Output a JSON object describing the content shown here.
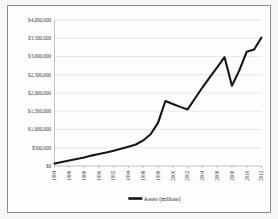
{
  "figure": {
    "background_color": "#fdfdfc",
    "border_color": "#8d8d8d",
    "line_color": "#161616",
    "grid_color": "#d2d2d2",
    "axis_color": "#9a9a9a"
  },
  "legend": {
    "position": "bottom-center",
    "entries": [
      {
        "label": "Assets (millions)",
        "color": "#161616",
        "marker": "line-swatch"
      }
    ]
  },
  "axes": {
    "y": {
      "ticks": [
        "$0",
        "$500,000",
        "$1,000,000",
        "$1,500,000",
        "$2,000,000",
        "$2,500,000",
        "$3,000,000",
        "$3,500,000",
        "$4,000,000"
      ]
    },
    "x": {
      "ticks": [
        "1984",
        "1986",
        "1988",
        "1990",
        "1992",
        "1994",
        "1996",
        "1998",
        "2000",
        "2002",
        "2004",
        "2006",
        "2008",
        "2010",
        "2012"
      ],
      "label_rotation": "-90"
    }
  },
  "chart_data": {
    "type": "line",
    "title": "",
    "xlabel": "",
    "ylabel": "",
    "xlim": [
      1984,
      2012
    ],
    "ylim": [
      0,
      4000000
    ],
    "ytick_values": [
      0,
      500000,
      1000000,
      1500000,
      2000000,
      2500000,
      3000000,
      3500000,
      4000000
    ],
    "ytick_labels": [
      "$0",
      "$500,000",
      "$1,000,000",
      "$1,500,000",
      "$2,000,000",
      "$2,500,000",
      "$3,000,000",
      "$3,500,000",
      "$4,000,000"
    ],
    "xtick_values": [
      1984,
      1986,
      1988,
      1990,
      1992,
      1994,
      1996,
      1998,
      2000,
      2002,
      2004,
      2006,
      2008,
      2010,
      2012
    ],
    "xtick_labels": [
      "1984",
      "1986",
      "1988",
      "1990",
      "1992",
      "1994",
      "1996",
      "1998",
      "2000",
      "2002",
      "2004",
      "2006",
      "2008",
      "2010",
      "2012"
    ],
    "grid": "horizontal",
    "legend_position": "bottom",
    "x": [
      1984,
      1985,
      1986,
      1987,
      1988,
      1989,
      1990,
      1991,
      1992,
      1993,
      1994,
      1995,
      1996,
      1997,
      1998,
      1999,
      2000,
      2001,
      2002,
      2003,
      2004,
      2005,
      2006,
      2007,
      2008,
      2009,
      2010,
      2011,
      2012
    ],
    "series": [
      {
        "name": "Assets (millions)",
        "color": "#161616",
        "values": [
          70000,
          110000,
          150000,
          190000,
          235000,
          285000,
          330000,
          370000,
          415000,
          470000,
          530000,
          590000,
          700000,
          870000,
          1180000,
          1780000,
          1700000,
          1620000,
          1550000,
          1850000,
          2150000,
          2430000,
          2700000,
          2980000,
          2200000,
          2620000,
          3130000,
          3190000,
          3520000
        ]
      }
    ]
  }
}
